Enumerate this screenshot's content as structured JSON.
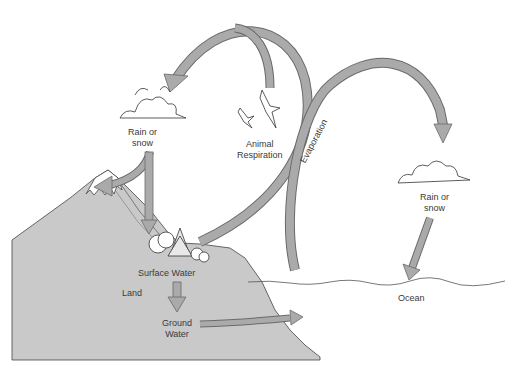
{
  "diagram": {
    "type": "water-cycle",
    "colors": {
      "land": "#c9c9c9",
      "arrow_fill": "#aaaaaa",
      "arrow_stroke": "#6a6a6a",
      "outline": "#444444",
      "snow": "#ffffff"
    },
    "labels": {
      "rain_left_1": "Rain or",
      "rain_left_2": "snow",
      "animal_1": "Animal",
      "animal_2": "Respiration",
      "evaporation": "Evaporation",
      "rain_right_1": "Rain or",
      "rain_right_2": "snow",
      "surface_water": "Surface Water",
      "land": "Land",
      "ground_1": "Ground",
      "ground_2": "Water",
      "ocean": "Ocean"
    },
    "icons": [
      "cloud-left",
      "cloud-right",
      "bird-1",
      "bird-2",
      "trees",
      "mountain",
      "ocean-surface"
    ]
  }
}
